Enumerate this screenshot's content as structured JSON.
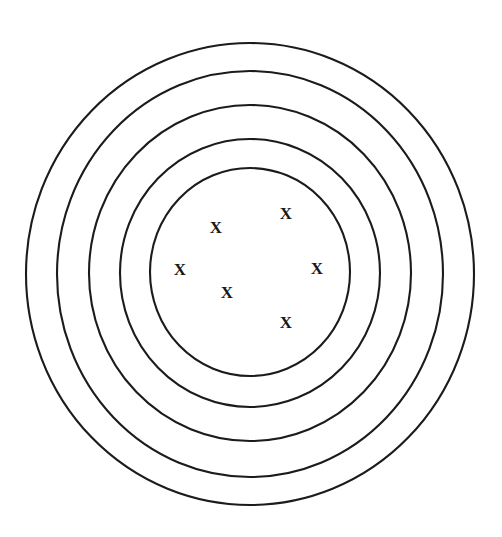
{
  "figure": {
    "background_color": "#ffffff",
    "stroke_color": "#1b1b1b",
    "mark_color": "#17171a",
    "stroke_width": 2.1,
    "canvas": {
      "width": 502,
      "height": 537
    }
  },
  "chart_data": {
    "type": "diagram",
    "title": "",
    "subtitle": "",
    "xlabel": "",
    "ylabel": "",
    "grid": false,
    "legend": "none",
    "center": {
      "x": 250,
      "y": 274
    },
    "series": [
      {
        "name": "concentric-rings",
        "shape": "ellipse",
        "count": 5,
        "values": [
          {
            "index": 1,
            "label": "ring-1-innermost",
            "cx": 250,
            "cy": 272,
            "rx": 100,
            "ry": 104
          },
          {
            "index": 2,
            "label": "ring-2",
            "cx": 250,
            "cy": 273,
            "rx": 130,
            "ry": 134
          },
          {
            "index": 3,
            "label": "ring-3",
            "cx": 250,
            "cy": 273,
            "rx": 161,
            "ry": 168
          },
          {
            "index": 4,
            "label": "ring-4",
            "cx": 250,
            "cy": 274,
            "rx": 193,
            "ry": 203
          },
          {
            "index": 5,
            "label": "ring-5-outermost",
            "cx": 250,
            "cy": 274,
            "rx": 224,
            "ry": 231
          }
        ]
      },
      {
        "name": "x-markers",
        "shape": "text-glyph",
        "glyph": "X",
        "count": 6,
        "values": [
          {
            "index": 1,
            "label": "x-mark-upper-left",
            "x": 216,
            "y": 229
          },
          {
            "index": 2,
            "label": "x-mark-upper-right",
            "x": 286,
            "y": 215
          },
          {
            "index": 3,
            "label": "x-mark-left",
            "x": 180,
            "y": 271
          },
          {
            "index": 4,
            "label": "x-mark-right",
            "x": 317,
            "y": 270
          },
          {
            "index": 5,
            "label": "x-mark-center",
            "x": 227,
            "y": 294
          },
          {
            "index": 6,
            "label": "x-mark-lower-right",
            "x": 286,
            "y": 324
          }
        ]
      }
    ]
  }
}
